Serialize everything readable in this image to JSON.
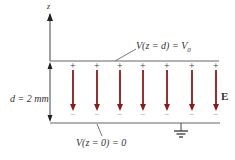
{
  "diagram": {
    "axis_label": "z",
    "top_plate_label": "V(z = d) = V",
    "top_plate_label_sub": "0",
    "bottom_plate_label": "V(z = 0) = 0",
    "separation_label": "d = 2 mm",
    "field_label": "E",
    "plus_sign": "+",
    "minus_sign": "−",
    "arrow_count": 7,
    "arrow_x": [
      73,
      97,
      120,
      143,
      167,
      192,
      216
    ],
    "colors": {
      "field_arrow": "#8b1a1a",
      "plate": "#555555",
      "text": "#333333"
    }
  }
}
